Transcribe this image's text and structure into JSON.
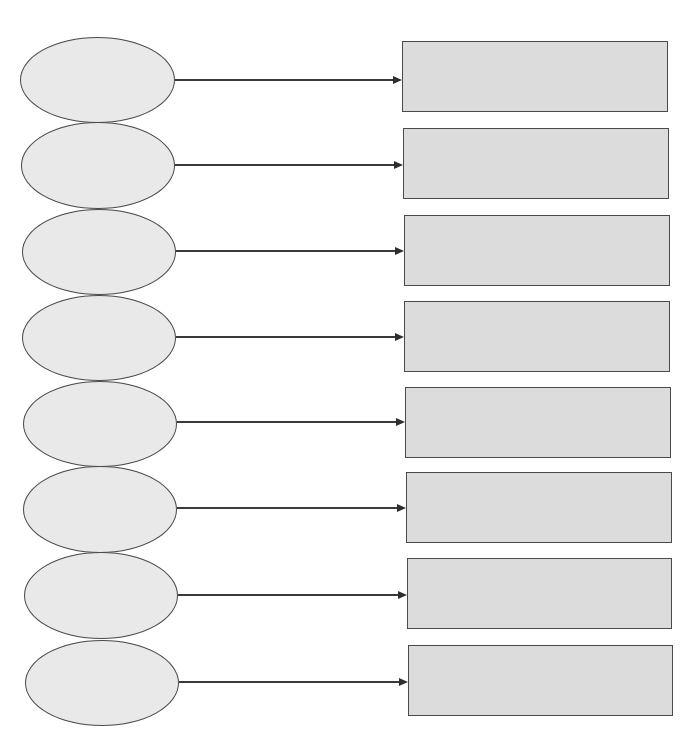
{
  "diagram": {
    "type": "blank-worksheet-flow",
    "colors": {
      "oval_fill": "#e9e9e9",
      "box_fill": "#dcdcdc",
      "stroke": "#4a4a4a",
      "arrow": "#3a3a3a",
      "background": "#ffffff"
    },
    "rows": [
      {
        "oval_text": "",
        "box_text": "",
        "oval": {
          "x": 20,
          "y": 37,
          "w": 155,
          "h": 86
        },
        "box": {
          "x": 402,
          "y": 41,
          "w": 266,
          "h": 71
        },
        "arrow_y": 80
      },
      {
        "oval_text": "",
        "box_text": "",
        "oval": {
          "x": 21,
          "y": 122,
          "w": 154,
          "h": 87
        },
        "box": {
          "x": 403,
          "y": 128,
          "w": 266,
          "h": 71
        },
        "arrow_y": 165
      },
      {
        "oval_text": "",
        "box_text": "",
        "oval": {
          "x": 22,
          "y": 209,
          "w": 154,
          "h": 86
        },
        "box": {
          "x": 404,
          "y": 215,
          "w": 266,
          "h": 71
        },
        "arrow_y": 251
      },
      {
        "oval_text": "",
        "box_text": "",
        "oval": {
          "x": 22,
          "y": 295,
          "w": 154,
          "h": 86
        },
        "box": {
          "x": 404,
          "y": 301,
          "w": 266,
          "h": 71
        },
        "arrow_y": 337
      },
      {
        "oval_text": "",
        "box_text": "",
        "oval": {
          "x": 23,
          "y": 381,
          "w": 154,
          "h": 86
        },
        "box": {
          "x": 405,
          "y": 387,
          "w": 266,
          "h": 71
        },
        "arrow_y": 422
      },
      {
        "oval_text": "",
        "box_text": "",
        "oval": {
          "x": 23,
          "y": 466,
          "w": 154,
          "h": 87
        },
        "box": {
          "x": 406,
          "y": 472,
          "w": 266,
          "h": 71
        },
        "arrow_y": 508
      },
      {
        "oval_text": "",
        "box_text": "",
        "oval": {
          "x": 24,
          "y": 552,
          "w": 154,
          "h": 87
        },
        "box": {
          "x": 407,
          "y": 558,
          "w": 265,
          "h": 71
        },
        "arrow_y": 595
      },
      {
        "oval_text": "",
        "box_text": "",
        "oval": {
          "x": 25,
          "y": 640,
          "w": 154,
          "h": 86
        },
        "box": {
          "x": 408,
          "y": 645,
          "w": 265,
          "h": 71
        },
        "arrow_y": 682
      }
    ]
  }
}
